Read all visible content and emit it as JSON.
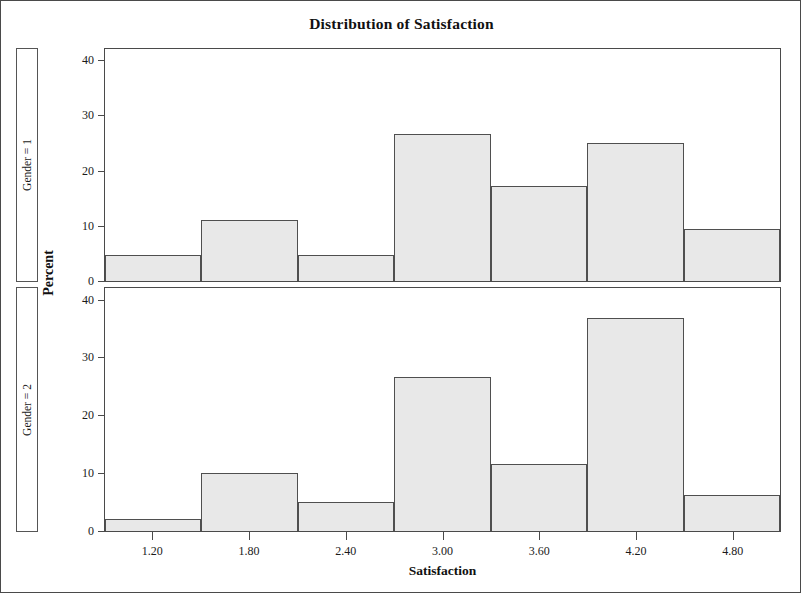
{
  "figure": {
    "title": "Distribution of Satisfaction",
    "xlabel": "Satisfaction",
    "ylabel": "Percent",
    "frame_color": "#4a4a4a",
    "bar_fill": "#e8e8e8",
    "bar_border": "#4f4f4f"
  },
  "panels": [
    {
      "strip_label": "Gender = 1"
    },
    {
      "strip_label": "Gender = 2"
    }
  ],
  "axes": {
    "y_ticks": [
      "0",
      "10",
      "20",
      "30",
      "40"
    ],
    "x_ticks": [
      "1.20",
      "1.80",
      "2.40",
      "3.00",
      "3.60",
      "4.20",
      "4.80"
    ]
  },
  "chart_data": {
    "type": "bar",
    "title": "Distribution of Satisfaction",
    "subtitle": "",
    "xlabel": "Satisfaction",
    "ylabel": "Percent",
    "xlim": [
      0.9,
      5.1
    ],
    "ylim": [
      0,
      42
    ],
    "y_ticks": [
      0,
      10,
      20,
      30,
      40
    ],
    "x_ticks": [
      1.2,
      1.8,
      2.4,
      3.0,
      3.6,
      4.2,
      4.8
    ],
    "grid": false,
    "legend": false,
    "bin_width": 0.6,
    "bin_centers": [
      1.2,
      1.8,
      2.4,
      3.0,
      3.6,
      4.2,
      4.8
    ],
    "bin_edges": [
      0.9,
      1.5,
      2.1,
      2.7,
      3.3,
      3.9,
      4.5,
      5.1
    ],
    "panels": [
      {
        "name": "Gender = 1",
        "values": [
          4.8,
          11.0,
          4.8,
          26.7,
          17.2,
          25.0,
          9.4
        ]
      },
      {
        "name": "Gender = 2",
        "values": [
          2.1,
          10.1,
          5.0,
          26.7,
          11.5,
          36.9,
          6.3
        ]
      }
    ]
  }
}
